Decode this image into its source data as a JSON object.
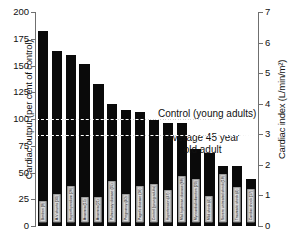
{
  "chart_data": {
    "type": "bar",
    "title": "",
    "xlabel": "",
    "ylabel": "Cardiac output (per cent of control)",
    "ylabel_right": "Cardiac index (L/min/m²)",
    "ylim": [
      0,
      200
    ],
    "ylim_right": [
      0,
      7
    ],
    "yticks": [
      "0",
      "25",
      "50",
      "75",
      "100",
      "125",
      "150",
      "175",
      "200"
    ],
    "yticks_right": [
      "0",
      "1",
      "2",
      "3",
      "4",
      "5",
      "6",
      "7"
    ],
    "grid": false,
    "legend": "none",
    "categories": [
      "Beriberi (8)",
      "A-V shunts (30)",
      "Hyperthyroidism (26)",
      "Anaemia (15)",
      "Anaemia (21)",
      "Pulmonary disease (35)",
      "Pregnancy (40)",
      "Paget's disease (16)",
      "Control (young adults)",
      "Hypertension (47)",
      "Mal. hydrocar. disease (68)",
      "Myocardial infarction (20)",
      "Mild shock (4)",
      "Severe untreated shock (18)",
      "Traumatic shock (4)",
      "Cardiac shock (17)"
    ],
    "values": [
      182,
      164,
      160,
      151,
      133,
      114,
      108,
      107,
      99,
      96,
      96,
      72,
      68,
      56,
      56,
      44
    ],
    "annotations": [
      {
        "label": "Control (young adults)",
        "value": 100
      },
      {
        "label": "Average 45 year",
        "label2": "old adult",
        "value": 85
      }
    ],
    "reference_lines": [
      100,
      85
    ],
    "bar_color": "#0a0a0a"
  }
}
